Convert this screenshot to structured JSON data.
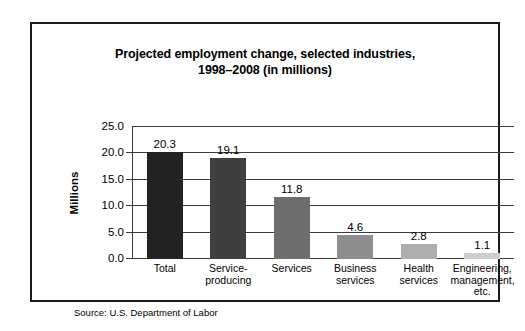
{
  "figure": {
    "source_note": "Source: U.S. Department of Labor"
  },
  "chart_data": {
    "type": "bar",
    "title": "Projected employment change, selected industries, 1998–2008 (in millions)",
    "title_line1": "Projected employment change, selected industries,",
    "title_line2": "1998–2008 (in millions)",
    "xlabel": "",
    "ylabel": "Millions",
    "ylim": [
      0,
      25
    ],
    "ytick_labels": [
      "25.0",
      "20.0",
      "15.0",
      "10.0",
      "5.0",
      "0.0"
    ],
    "ytick_values": [
      25,
      20,
      15,
      10,
      5,
      0
    ],
    "grid": true,
    "legend": false,
    "categories": [
      "Total",
      "Service-producing",
      "Services",
      "Business services",
      "Health services",
      "Engineering, management, etc."
    ],
    "category_lines": [
      [
        "Total"
      ],
      [
        "Service-",
        "producing"
      ],
      [
        "Services"
      ],
      [
        "Business",
        "services"
      ],
      [
        "Health",
        "services"
      ],
      [
        "Engineering,",
        "management,",
        "etc."
      ]
    ],
    "values": [
      20.3,
      19.1,
      11.8,
      4.6,
      2.8,
      1.1
    ],
    "value_labels": [
      "20.3",
      "19.1",
      "11.8",
      "4.6",
      "2.8",
      "1.1"
    ],
    "bar_colors": [
      "#232323",
      "#3f3f3f",
      "#6e6e6e",
      "#8e8e8e",
      "#aeaeae",
      "#cdcdcd"
    ]
  },
  "colors": {
    "frame_border": "#1b1b1b",
    "shadow": "#2a2a2a",
    "gridline": "#3a3a3a",
    "text": "#000000",
    "background": "#ffffff"
  }
}
